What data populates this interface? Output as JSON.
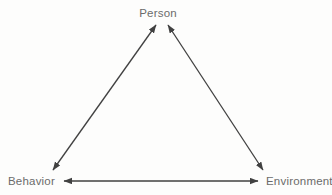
{
  "diagram": {
    "type": "triangle",
    "background": "#fdfdfc",
    "colors": {
      "arrow": "#414141",
      "label": "#6b6b6b"
    },
    "nodes": [
      {
        "id": "person",
        "label": "Person",
        "position": "top"
      },
      {
        "id": "behavior",
        "label": "Behavior",
        "position": "bottom-left"
      },
      {
        "id": "environment",
        "label": "Environment",
        "position": "bottom-right"
      }
    ],
    "edges": [
      {
        "from": "behavior",
        "to": "person",
        "bidirectional": true
      },
      {
        "from": "environment",
        "to": "person",
        "bidirectional": true
      },
      {
        "from": "behavior",
        "to": "environment",
        "bidirectional": true
      }
    ]
  }
}
